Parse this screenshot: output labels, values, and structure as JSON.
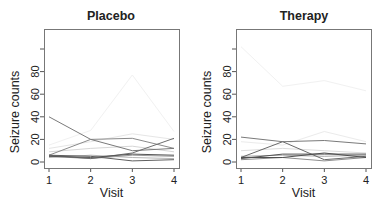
{
  "figure": {
    "width": 384,
    "height": 207
  },
  "chart_data": [
    {
      "type": "line",
      "title": "Placebo",
      "xlabel": "Visit",
      "ylabel": "Seizure counts",
      "x": [
        1,
        2,
        3,
        4
      ],
      "x_ticks": [
        "1",
        "2",
        "3",
        "4"
      ],
      "y_ticks": [
        0,
        20,
        40,
        60,
        80,
        100
      ],
      "y_tick_labels": [
        "0",
        "20",
        "40",
        "60",
        "80",
        ""
      ],
      "ylim": [
        -4,
        118
      ],
      "xlim": [
        0.88,
        4.12
      ],
      "grid": false,
      "legend": null,
      "series": [
        {
          "name": "subject-1",
          "values": [
            40,
            20,
            10,
            12
          ],
          "color": "#7a7a7a"
        },
        {
          "name": "subject-2",
          "values": [
            6,
            20,
            21,
            12
          ],
          "color": "#8a8a8a"
        },
        {
          "name": "subject-3",
          "values": [
            6,
            3,
            8,
            21
          ],
          "color": "#6e6e6e"
        },
        {
          "name": "subject-4",
          "values": [
            5,
            4,
            7,
            6
          ],
          "color": "#555555"
        },
        {
          "name": "subject-5",
          "values": [
            6,
            5,
            1,
            2
          ],
          "color": "#5f5f5f"
        },
        {
          "name": "subject-6",
          "values": [
            5,
            3,
            6,
            5
          ],
          "color": "#9a9a9a"
        },
        {
          "name": "subject-7",
          "values": [
            4,
            6,
            4,
            3
          ],
          "color": "#b5b5b5"
        },
        {
          "name": "subject-8",
          "values": [
            15,
            28,
            77,
            27
          ],
          "color": "#f1f1f1"
        },
        {
          "name": "subject-9",
          "values": [
            12,
            18,
            25,
            20
          ],
          "color": "#e6e6e6"
        },
        {
          "name": "subject-10",
          "values": [
            9,
            12,
            14,
            9
          ],
          "color": "#d6d6d6"
        }
      ]
    },
    {
      "type": "line",
      "title": "Therapy",
      "xlabel": "Visit",
      "ylabel": "Seizure counts",
      "x": [
        1,
        2,
        3,
        4
      ],
      "x_ticks": [
        "1",
        "2",
        "3",
        "4"
      ],
      "y_ticks": [
        0,
        20,
        40,
        60,
        80,
        100
      ],
      "y_tick_labels": [
        "0",
        "20",
        "40",
        "60",
        "80",
        ""
      ],
      "ylim": [
        -4,
        118
      ],
      "xlim": [
        0.88,
        4.12
      ],
      "grid": false,
      "legend": null,
      "series": [
        {
          "name": "subject-1",
          "values": [
            22,
            18,
            19,
            16
          ],
          "color": "#7a7a7a"
        },
        {
          "name": "subject-2",
          "values": [
            4,
            18,
            2,
            5
          ],
          "color": "#6a6a6a"
        },
        {
          "name": "subject-3",
          "values": [
            3,
            7,
            7,
            7
          ],
          "color": "#555555"
        },
        {
          "name": "subject-4",
          "values": [
            4,
            4,
            8,
            4
          ],
          "color": "#4f4f4f"
        },
        {
          "name": "subject-5",
          "values": [
            2,
            4,
            1,
            4
          ],
          "color": "#8f8f8f"
        },
        {
          "name": "subject-6",
          "values": [
            5,
            6,
            5,
            6
          ],
          "color": "#a8a8a8"
        },
        {
          "name": "subject-7",
          "values": [
            102,
            67,
            72,
            63
          ],
          "color": "#f1f1f1"
        },
        {
          "name": "subject-8",
          "values": [
            18,
            15,
            27,
            18
          ],
          "color": "#ebebeb"
        },
        {
          "name": "subject-9",
          "values": [
            10,
            12,
            10,
            8
          ],
          "color": "#dcdcdc"
        }
      ]
    }
  ],
  "panels_layout": [
    {
      "frame": [
        44,
        29,
        179,
        168
      ],
      "title_x": 111,
      "title_y": 20
    },
    {
      "frame": [
        236,
        29,
        371,
        168
      ],
      "title_x": 304,
      "title_y": 20
    }
  ]
}
